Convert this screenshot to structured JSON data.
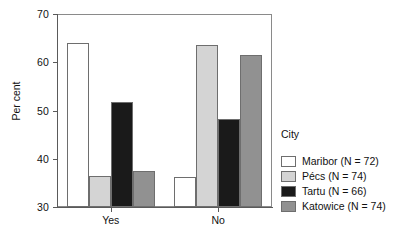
{
  "chart_data": {
    "type": "bar",
    "title": "",
    "xlabel": "",
    "ylabel": "Per cent",
    "categories": [
      "Yes",
      "No"
    ],
    "ylim": [
      30,
      70
    ],
    "yticks": [
      30,
      40,
      50,
      60,
      70
    ],
    "grid": false,
    "legend_position": "right",
    "legend_title": "City",
    "series": [
      {
        "name": "Maribor  (N = 72)",
        "short": "Maribor",
        "n": 72,
        "color": "#ffffff",
        "values": [
          64.0,
          36.2
        ]
      },
      {
        "name": "Pécs (N = 74)",
        "short": "Pécs",
        "n": 74,
        "color": "#d4d4d4",
        "values": [
          36.5,
          63.6
        ]
      },
      {
        "name": "Tartu (N = 66)",
        "short": "Tartu",
        "n": 66,
        "color": "#1a1a1a",
        "values": [
          51.8,
          48.2
        ]
      },
      {
        "name": "Katowice (N = 74)",
        "short": "Katowice",
        "n": 74,
        "color": "#919191",
        "values": [
          37.4,
          61.4
        ]
      }
    ]
  },
  "axis": {
    "y_tick_labels": [
      "30",
      "40",
      "50",
      "60",
      "70"
    ],
    "y_title": "Per cent",
    "x_tick_labels": [
      "Yes",
      "No"
    ]
  },
  "legend": {
    "title": "City",
    "items": [
      {
        "label": "Maribor  (N = 72)",
        "color": "#ffffff"
      },
      {
        "label": "Pécs (N = 74)",
        "color": "#d4d4d4"
      },
      {
        "label": "Tartu (N = 66)",
        "color": "#1a1a1a"
      },
      {
        "label": "Katowice (N = 74)",
        "color": "#919191"
      }
    ]
  }
}
